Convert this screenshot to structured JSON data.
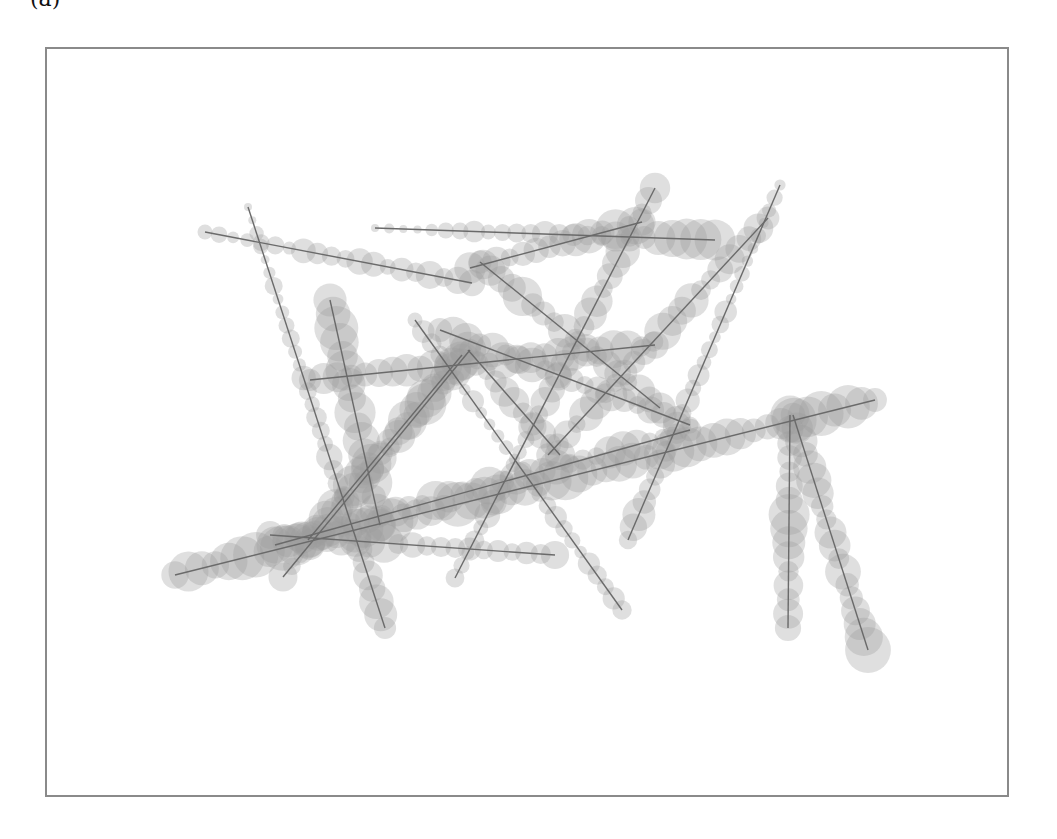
{
  "caption": "(a)",
  "style": {
    "frame_color": "#8a8a8a",
    "circle_color": "#9a9a9a",
    "circle_opacity": 0.32,
    "line_color": "#6a6a6a",
    "line_width": 1.4
  },
  "strands": [
    {
      "from": [
        205,
        232
      ],
      "to": [
        472,
        283
      ],
      "radius": [
        8,
        14
      ]
    },
    {
      "from": [
        248,
        207
      ],
      "to": [
        385,
        628
      ],
      "radius": [
        5,
        16
      ]
    },
    {
      "from": [
        375,
        228
      ],
      "to": [
        715,
        240
      ],
      "radius": [
        5,
        17
      ]
    },
    {
      "from": [
        470,
        268
      ],
      "to": [
        642,
        222
      ],
      "radius": [
        14,
        16
      ]
    },
    {
      "from": [
        655,
        188
      ],
      "to": [
        455,
        578
      ],
      "radius": [
        15,
        10
      ]
    },
    {
      "from": [
        480,
        262
      ],
      "to": [
        660,
        408
      ],
      "radius": [
        18,
        14
      ]
    },
    {
      "from": [
        415,
        320
      ],
      "to": [
        622,
        610
      ],
      "radius": [
        9,
        9
      ]
    },
    {
      "from": [
        310,
        380
      ],
      "to": [
        655,
        345
      ],
      "radius": [
        12,
        16
      ]
    },
    {
      "from": [
        780,
        185
      ],
      "to": [
        628,
        540
      ],
      "radius": [
        6,
        14
      ]
    },
    {
      "from": [
        768,
        218
      ],
      "to": [
        548,
        455
      ],
      "radius": [
        16,
        14
      ]
    },
    {
      "from": [
        175,
        575
      ],
      "to": [
        875,
        400
      ],
      "radius": [
        18,
        18
      ]
    },
    {
      "from": [
        790,
        415
      ],
      "to": [
        788,
        628
      ],
      "radius": [
        16,
        16
      ]
    },
    {
      "from": [
        793,
        415
      ],
      "to": [
        868,
        650
      ],
      "radius": [
        16,
        18
      ]
    },
    {
      "from": [
        283,
        577
      ],
      "to": [
        470,
        350
      ],
      "radius": [
        12,
        18
      ]
    },
    {
      "from": [
        270,
        535
      ],
      "to": [
        555,
        555
      ],
      "radius": [
        18,
        12
      ]
    },
    {
      "from": [
        330,
        300
      ],
      "to": [
        380,
        525
      ],
      "radius": [
        18,
        18
      ]
    },
    {
      "from": [
        440,
        330
      ],
      "to": [
        690,
        425
      ],
      "radius": [
        16,
        14
      ]
    },
    {
      "from": [
        308,
        540
      ],
      "to": [
        462,
        355
      ],
      "radius": [
        16,
        16
      ]
    },
    {
      "from": [
        275,
        545
      ],
      "to": [
        690,
        430
      ],
      "radius": [
        16,
        14
      ]
    },
    {
      "from": [
        468,
        350
      ],
      "to": [
        560,
        455
      ],
      "radius": [
        14,
        16
      ]
    }
  ]
}
